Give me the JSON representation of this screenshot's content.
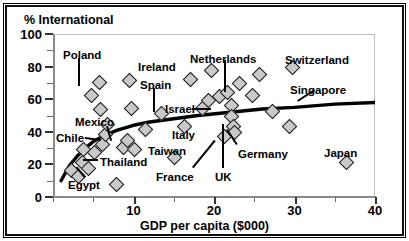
{
  "chart_data": {
    "type": "scatter",
    "title": "",
    "xlabel": "GDP per capita ($000)",
    "ylabel": "% International",
    "xlim": [
      0,
      40
    ],
    "ylim": [
      0,
      100
    ],
    "xticks": [
      0,
      5,
      10,
      15,
      20,
      25,
      30,
      35,
      40
    ],
    "xtick_labels": [
      "",
      "",
      "10",
      "",
      "20",
      "",
      "30",
      "",
      "40"
    ],
    "yticks": [
      0,
      10,
      20,
      30,
      40,
      50,
      60,
      70,
      80,
      90,
      100
    ],
    "ytick_labels": [
      "0",
      "",
      "20",
      "",
      "40",
      "",
      "60",
      "",
      "80",
      "",
      "100"
    ],
    "grid": false,
    "legend": false,
    "marker": "diamond",
    "points": [
      {
        "x": 2.2,
        "y": 17,
        "label": ""
      },
      {
        "x": 3.1,
        "y": 13,
        "label": "Egypt"
      },
      {
        "x": 3.6,
        "y": 22,
        "label": "Thailand"
      },
      {
        "x": 3.7,
        "y": 30,
        "label": ""
      },
      {
        "x": 4.3,
        "y": 18,
        "label": ""
      },
      {
        "x": 4.6,
        "y": 63,
        "label": "Poland"
      },
      {
        "x": 5.0,
        "y": 28,
        "label": ""
      },
      {
        "x": 5.6,
        "y": 71,
        "label": ""
      },
      {
        "x": 5.8,
        "y": 54,
        "label": ""
      },
      {
        "x": 6.0,
        "y": 33,
        "label": ""
      },
      {
        "x": 6.4,
        "y": 39,
        "label": "Chile"
      },
      {
        "x": 6.6,
        "y": 45,
        "label": "Mexico"
      },
      {
        "x": 7.8,
        "y": 8,
        "label": ""
      },
      {
        "x": 8.6,
        "y": 31,
        "label": ""
      },
      {
        "x": 9.1,
        "y": 35,
        "label": ""
      },
      {
        "x": 9.4,
        "y": 72,
        "label": "Ireland"
      },
      {
        "x": 9.6,
        "y": 55,
        "label": ""
      },
      {
        "x": 10.0,
        "y": 30,
        "label": ""
      },
      {
        "x": 11.4,
        "y": 42,
        "label": ""
      },
      {
        "x": 13.3,
        "y": 52,
        "label": "Spain"
      },
      {
        "x": 15.0,
        "y": 25,
        "label": "Taiwan"
      },
      {
        "x": 16.2,
        "y": 44,
        "label": ""
      },
      {
        "x": 17.0,
        "y": 73,
        "label": ""
      },
      {
        "x": 18.4,
        "y": 55,
        "label": ""
      },
      {
        "x": 19.2,
        "y": 60,
        "label": "Israel"
      },
      {
        "x": 19.6,
        "y": 78,
        "label": "Netherlands"
      },
      {
        "x": 20.6,
        "y": 62,
        "label": ""
      },
      {
        "x": 21.2,
        "y": 38,
        "label": ""
      },
      {
        "x": 21.6,
        "y": 65,
        "label": ""
      },
      {
        "x": 22.0,
        "y": 57,
        "label": ""
      },
      {
        "x": 22.1,
        "y": 50,
        "label": "UK"
      },
      {
        "x": 22.3,
        "y": 44,
        "label": "France"
      },
      {
        "x": 22.4,
        "y": 40,
        "label": "Germany"
      },
      {
        "x": 23.0,
        "y": 70,
        "label": ""
      },
      {
        "x": 24.6,
        "y": 63,
        "label": ""
      },
      {
        "x": 25.5,
        "y": 76,
        "label": ""
      },
      {
        "x": 27.2,
        "y": 53,
        "label": "Singapore"
      },
      {
        "x": 29.2,
        "y": 44,
        "label": ""
      },
      {
        "x": 29.6,
        "y": 80,
        "label": "Switzerland"
      },
      {
        "x": 36.3,
        "y": 22,
        "label": "Japan"
      }
    ],
    "trend_line": {
      "style": "thick-solid-black",
      "description": "logarithmic best-fit curve rising from ~10% at low GDP to ~58% at GDP 40",
      "points": [
        {
          "x": 1.0,
          "y": 10
        },
        {
          "x": 2.0,
          "y": 19
        },
        {
          "x": 3.0,
          "y": 25
        },
        {
          "x": 4.0,
          "y": 30
        },
        {
          "x": 5.0,
          "y": 34
        },
        {
          "x": 6.5,
          "y": 38
        },
        {
          "x": 8.0,
          "y": 41
        },
        {
          "x": 10.0,
          "y": 44
        },
        {
          "x": 12.0,
          "y": 46
        },
        {
          "x": 15.0,
          "y": 48
        },
        {
          "x": 18.0,
          "y": 50
        },
        {
          "x": 22.0,
          "y": 52
        },
        {
          "x": 26.0,
          "y": 54
        },
        {
          "x": 30.0,
          "y": 55
        },
        {
          "x": 35.0,
          "y": 57
        },
        {
          "x": 40.0,
          "y": 58
        }
      ]
    },
    "annotations": [
      {
        "name": "Poland",
        "label_x": 63,
        "label_y": 50,
        "leader": [
          [
            80,
            58
          ],
          [
            80,
            86
          ]
        ]
      },
      {
        "name": "Mexico",
        "label_x": 75,
        "label_y": 117,
        "leader": [
          [
            108,
            126
          ],
          [
            112,
            140
          ]
        ]
      },
      {
        "name": "Chile",
        "label_x": 56,
        "label_y": 133,
        "leader": [
          [
            85,
            137
          ],
          [
            101,
            139
          ]
        ]
      },
      {
        "name": "Thailand",
        "label_x": 100,
        "label_y": 157,
        "leader": [
          [
            98,
            161
          ],
          [
            83,
            161
          ]
        ]
      },
      {
        "name": "Egypt",
        "label_x": 68,
        "label_y": 180,
        "leader": [
          [
            84,
            178
          ],
          [
            76,
            168
          ]
        ]
      },
      {
        "name": "Ireland",
        "label_x": 138,
        "label_y": 62,
        "leader": []
      },
      {
        "name": "Spain",
        "label_x": 140,
        "label_y": 80,
        "leader": [
          [
            155,
            88
          ],
          [
            155,
            112
          ]
        ]
      },
      {
        "name": "Israel",
        "label_x": 165,
        "label_y": 104,
        "leader": [
          [
            192,
            108
          ],
          [
            211,
            108
          ]
        ]
      },
      {
        "name": "Netherlands",
        "label_x": 190,
        "label_y": 54,
        "leader": [
          [
            226,
            60
          ],
          [
            226,
            92
          ]
        ]
      },
      {
        "name": "Taiwan",
        "label_x": 148,
        "label_y": 146,
        "leader": []
      },
      {
        "name": "Italy",
        "label_x": 172,
        "label_y": 130,
        "leader": []
      },
      {
        "name": "France",
        "label_x": 156,
        "label_y": 172,
        "leader": [
          [
            192,
            167
          ],
          [
            214,
            140
          ]
        ]
      },
      {
        "name": "UK",
        "label_x": 215,
        "label_y": 172,
        "leader": [
          [
            222,
            168
          ],
          [
            222,
            124
          ]
        ]
      },
      {
        "name": "Germany",
        "label_x": 238,
        "label_y": 149,
        "leader": [
          [
            236,
            145
          ],
          [
            226,
            130
          ]
        ]
      },
      {
        "name": "Switzerland",
        "label_x": 285,
        "label_y": 55,
        "leader": []
      },
      {
        "name": "Singapore",
        "label_x": 290,
        "label_y": 85,
        "leader": [
          [
            315,
            91
          ],
          [
            298,
            102
          ]
        ]
      },
      {
        "name": "Japan",
        "label_x": 324,
        "label_y": 148,
        "leader": []
      }
    ]
  }
}
